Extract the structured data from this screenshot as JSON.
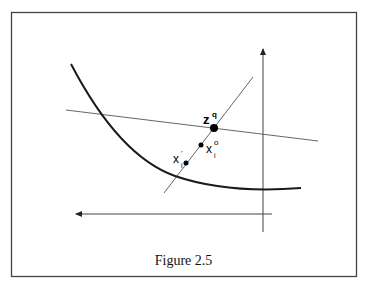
{
  "figure": {
    "caption": "Figure 2.5",
    "labels": {
      "zq": {
        "base": "z",
        "sup": "q"
      },
      "xio": {
        "base": "x",
        "sub": "i",
        "sup": "o"
      },
      "xip": {
        "base": "x",
        "sub": "i",
        "sup": "'"
      }
    },
    "colors": {
      "stroke": "#222222",
      "thin_stroke": "#555555",
      "frame": "#444444"
    }
  }
}
